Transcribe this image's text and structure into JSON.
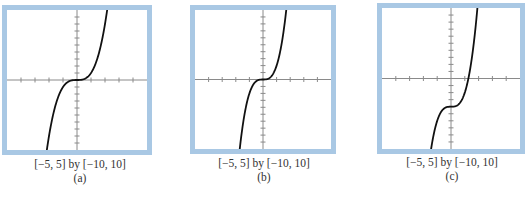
{
  "chart_data": [
    {
      "type": "line",
      "label": "(a)",
      "window": "[−5, 5] by [−10, 10]",
      "xlim": [
        -5,
        5
      ],
      "ylim": [
        -10,
        10
      ],
      "x_tick_step": 1,
      "y_tick_step": 1,
      "curve_description": "cubic y = x^3",
      "x": [
        -2.15,
        -1.5,
        -1,
        -0.5,
        0,
        0.5,
        1,
        1.5,
        2.15
      ],
      "y": [
        -10,
        -3.4,
        -1,
        -0.1,
        0,
        0.1,
        1,
        3.4,
        10
      ]
    },
    {
      "type": "line",
      "label": "(b)",
      "window": "[−5, 5] by [−10, 10]",
      "xlim": [
        -5,
        5
      ],
      "ylim": [
        -10,
        10
      ],
      "x_tick_step": 1,
      "y_tick_step": 1,
      "curve_description": "steeper cubic y = 2x^3",
      "x": [
        -1.71,
        -1.25,
        -1,
        -0.5,
        0,
        0.5,
        1,
        1.25,
        1.71
      ],
      "y": [
        -10,
        -3.9,
        -2,
        -0.25,
        0,
        0.25,
        2,
        3.9,
        10
      ]
    },
    {
      "type": "line",
      "label": "(c)",
      "window": "[−5, 5] by [−10, 10]",
      "xlim": [
        -5,
        5
      ],
      "ylim": [
        -10,
        10
      ],
      "x_tick_step": 1,
      "y_tick_step": 1,
      "curve_description": "cubic shifted down, y = 2x^3 − 4",
      "x": [
        -1.44,
        -1,
        -0.5,
        0,
        0.5,
        1,
        1.26,
        1.5,
        1.91
      ],
      "y": [
        -10,
        -6,
        -4.25,
        -4,
        -3.75,
        -2,
        0,
        2.75,
        10
      ]
    }
  ],
  "panels": [
    {
      "caption": "[−5, 5] by [−10, 10]",
      "label": "(a)"
    },
    {
      "caption": "[−5, 5] by [−10, 10]",
      "label": "(b)"
    },
    {
      "caption": "[−5, 5] by [−10, 10]",
      "label": "(c)"
    }
  ],
  "colors": {
    "frame": "#a9c8e4",
    "axis": "#8a8a8a",
    "curve": "#111111"
  }
}
